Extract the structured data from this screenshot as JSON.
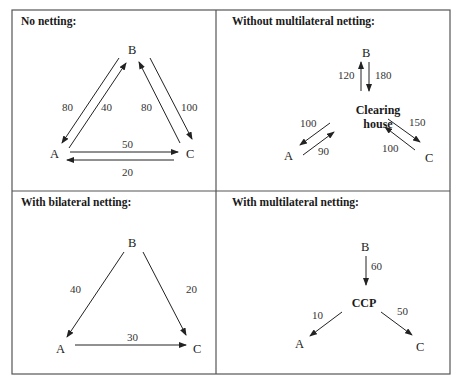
{
  "panels": [
    {
      "title": "No netting:",
      "nodes": {
        "A": "A",
        "B": "B",
        "C": "C"
      },
      "edges": [
        {
          "from": "B",
          "to": "A",
          "value": "80"
        },
        {
          "from": "A",
          "to": "B",
          "value": "40"
        },
        {
          "from": "C",
          "to": "B",
          "value": "80"
        },
        {
          "from": "B",
          "to": "C",
          "value": "100"
        },
        {
          "from": "A",
          "to": "C",
          "value": "50"
        },
        {
          "from": "C",
          "to": "A",
          "value": "20"
        }
      ]
    },
    {
      "title": "Without multilateral netting:",
      "nodes": {
        "A": "A",
        "B": "B",
        "C": "C",
        "hub_line1": "Clearing",
        "hub_line2": "house"
      },
      "edges": [
        {
          "from": "Clearing house",
          "to": "B",
          "value": "120"
        },
        {
          "from": "B",
          "to": "Clearing house",
          "value": "180"
        },
        {
          "from": "Clearing house",
          "to": "A",
          "value": "100"
        },
        {
          "from": "A",
          "to": "Clearing house",
          "value": "90"
        },
        {
          "from": "Clearing house",
          "to": "C",
          "value": "150"
        },
        {
          "from": "C",
          "to": "Clearing house",
          "value": "100"
        }
      ]
    },
    {
      "title": "With bilateral netting:",
      "nodes": {
        "A": "A",
        "B": "B",
        "C": "C"
      },
      "edges": [
        {
          "from": "B",
          "to": "A",
          "value": "40"
        },
        {
          "from": "B",
          "to": "C",
          "value": "20"
        },
        {
          "from": "A",
          "to": "C",
          "value": "30"
        }
      ]
    },
    {
      "title": "With multilateral netting:",
      "nodes": {
        "A": "A",
        "B": "B",
        "C": "C",
        "hub": "CCP"
      },
      "edges": [
        {
          "from": "B",
          "to": "CCP",
          "value": "60"
        },
        {
          "from": "CCP",
          "to": "A",
          "value": "10"
        },
        {
          "from": "CCP",
          "to": "C",
          "value": "50"
        }
      ]
    }
  ]
}
